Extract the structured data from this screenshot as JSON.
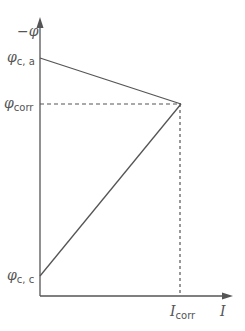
{
  "diagram": {
    "type": "evans-diagram",
    "axes": {
      "y_label": "−φ",
      "x_label": "I"
    },
    "labels": {
      "phi_ca_main": "φ",
      "phi_ca_sub": "c, a",
      "phi_corr_main": "φ",
      "phi_corr_sub": "corr",
      "phi_cc_main": "φ",
      "phi_cc_sub": "c, c",
      "i_corr_main": "I",
      "i_corr_sub": "corr"
    },
    "colors": {
      "line": "#555555",
      "text": "#555555"
    },
    "lines": [
      {
        "name": "anodic-line",
        "from": "φc,a",
        "to": "intersection"
      },
      {
        "name": "cathodic-line",
        "from": "φc,c",
        "to": "intersection"
      }
    ]
  }
}
